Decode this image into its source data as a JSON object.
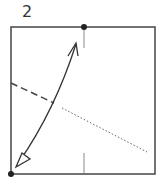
{
  "diagram": {
    "step_number": "2",
    "type": "origami-fold-step",
    "elements": {
      "paper": "square",
      "reference_dots": [
        "top-center",
        "bottom-left-corner"
      ],
      "fold_arrow": "double-headed curved arrow from bottom-left corner to top-center",
      "valley_fold_line": "dashed, from left edge toward center",
      "hidden_line": "dotted, continuing toward lower right",
      "center_marks": [
        "top",
        "bottom"
      ]
    }
  }
}
